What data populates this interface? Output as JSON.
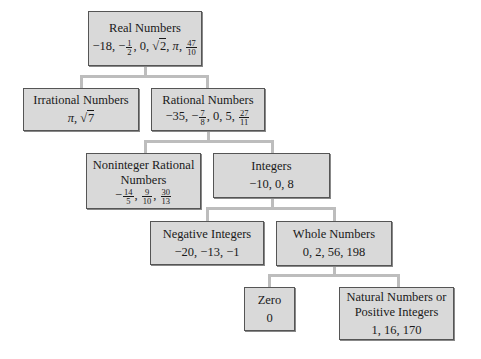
{
  "diagram": {
    "colors": {
      "box_fill": "#d9d9d9",
      "box_border": "#555555",
      "connector": "#bdbdbd",
      "background": "#ffffff"
    },
    "nodes": {
      "real": {
        "title": "Real Numbers",
        "values_text": "−18, −1/2, 0, √2, π, 47/10",
        "v": [
          "−18, −",
          "1",
          "2",
          ", 0, ",
          "2",
          ", ",
          "π",
          ", ",
          "47",
          "10"
        ]
      },
      "irrational": {
        "title": "Irrational Numbers",
        "values_text": "π, √7",
        "v": [
          "π",
          ", ",
          "7"
        ]
      },
      "rational": {
        "title": "Rational Numbers",
        "values_text": "−35, −7/8, 0, 5, 27/11",
        "v": [
          "−35, −",
          "7",
          "8",
          ", 0, 5, ",
          "27",
          "11"
        ]
      },
      "noninteger": {
        "title_line1": "Noninteger Rational",
        "title_line2": "Numbers",
        "values_text": "−14/5, 9/10, 30/13",
        "v": [
          "−",
          "14",
          "5",
          ", ",
          "9",
          "10",
          ", ",
          "30",
          "13"
        ]
      },
      "integers": {
        "title": "Integers",
        "values": "−10, 0, 8"
      },
      "negative": {
        "title": "Negative Integers",
        "values": "−20, −13, −1"
      },
      "whole": {
        "title": "Whole Numbers",
        "values": "0, 2, 56, 198"
      },
      "zero": {
        "title": "Zero",
        "values": "0"
      },
      "natural": {
        "title_line1": "Natural Numbers or",
        "title_line2": "Positive Integers",
        "values": "1, 16, 170"
      }
    },
    "edges": [
      [
        "real",
        "irrational"
      ],
      [
        "real",
        "rational"
      ],
      [
        "rational",
        "noninteger"
      ],
      [
        "rational",
        "integers"
      ],
      [
        "integers",
        "negative"
      ],
      [
        "integers",
        "whole"
      ],
      [
        "whole",
        "zero"
      ],
      [
        "whole",
        "natural"
      ]
    ]
  }
}
